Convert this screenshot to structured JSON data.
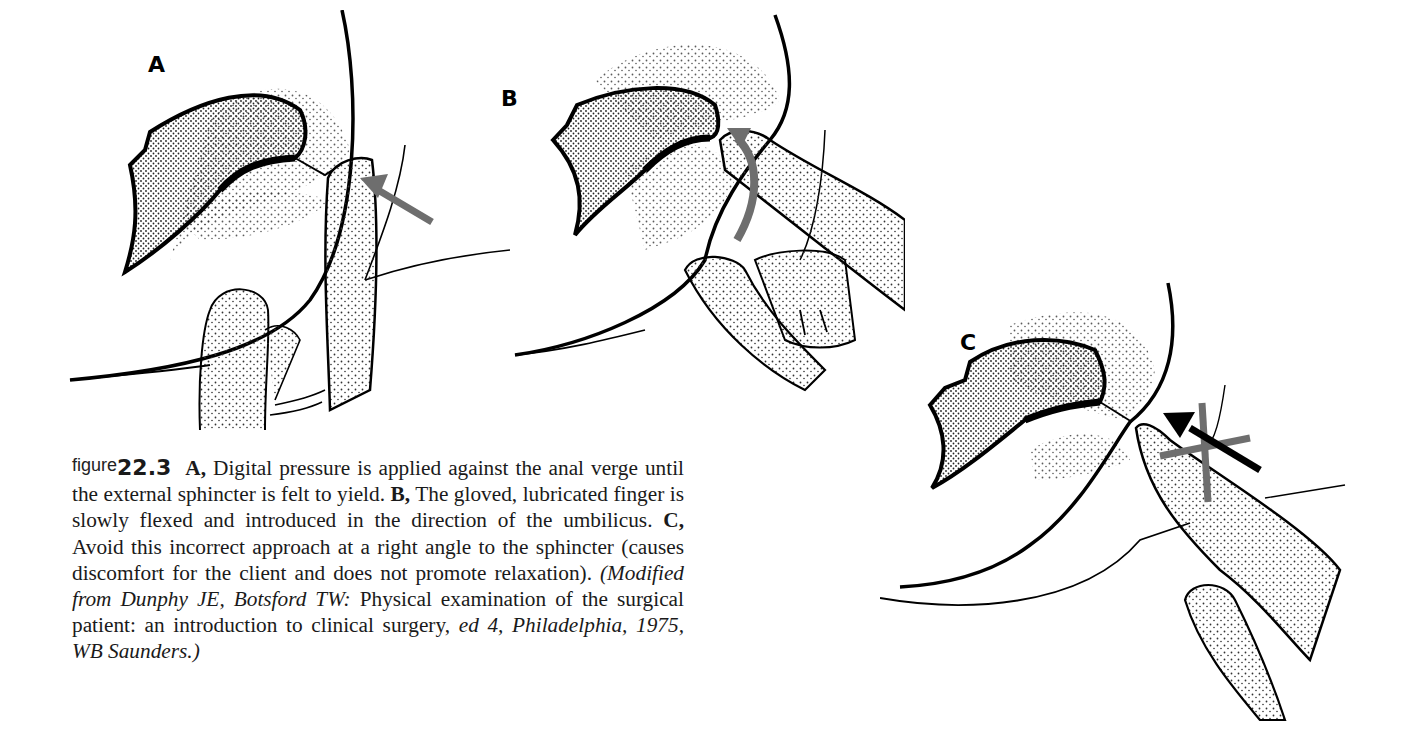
{
  "figure": {
    "prefix": "figure",
    "number": "22.3",
    "panels": [
      {
        "label": "A",
        "arrow": "gray-straight-arrow",
        "description": "Digital pressure against anal verge"
      },
      {
        "label": "B",
        "arrow": "gray-curved-arrow",
        "description": "Finger flexed toward umbilicus"
      },
      {
        "label": "C",
        "arrow": "black-arrow-with-gray-x",
        "description": "Incorrect right-angle approach"
      }
    ],
    "caption": {
      "a_label": "A,",
      "a_text": " Digital pressure is applied against the anal verge until the external sphincter is felt to yield. ",
      "b_label": "B,",
      "b_text": " The gloved, lubricated finger is slowly flexed and introduced in the direction of the umbilicus. ",
      "c_label": "C,",
      "c_text": " Avoid this incorrect approach at a right angle to the sphincter (causes discomfort for the client and does not promote relaxation). ",
      "source_italic_1": "(Modified from Dunphy JE, Botsford TW:",
      "source_roman": " Physical examination of the surgical patient: an introduction to clinical surgery, ",
      "source_italic_2": "ed 4, Philadelphia, 1975, WB Saunders.)"
    }
  },
  "colors": {
    "ink": "#000000",
    "arrow_gray": "#6e6e6e",
    "stipple": "#444444",
    "background": "#ffffff"
  }
}
